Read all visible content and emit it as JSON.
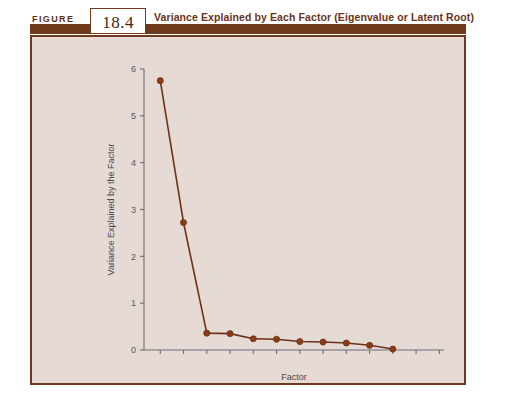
{
  "header": {
    "kicker": "FIGURE",
    "number": "18.4",
    "title": "Variance Explained by Each Factor (Eigenvalue or Latent Root)"
  },
  "colors": {
    "border": "#6e3a1c",
    "header_bar": "#6e3a1c",
    "title_text": "#6b3318",
    "panel_bg": "#e6dad4",
    "series": "#8a3c16",
    "axis": "#6e6a74"
  },
  "chart_data": {
    "type": "line",
    "title": "Variance Explained by Each Factor (Eigenvalue or Latent Root)",
    "xlabel": "Factor",
    "ylabel": "Variance Explained by the Factor",
    "x": [
      1,
      2,
      3,
      4,
      5,
      6,
      7,
      8,
      9,
      10,
      11
    ],
    "values": [
      5.75,
      2.72,
      0.36,
      0.35,
      0.24,
      0.23,
      0.18,
      0.17,
      0.15,
      0.1,
      0.02
    ],
    "ylim": [
      0,
      6
    ],
    "yticks": [
      0,
      1,
      2,
      3,
      4,
      5,
      6
    ],
    "ytick_labels": [
      "0",
      "1",
      "2",
      "3",
      "4",
      "5",
      "6"
    ],
    "xlim": [
      0.3,
      13.2
    ],
    "xticks": [
      1,
      2,
      3,
      4,
      5,
      6,
      7,
      8,
      9,
      10,
      11,
      12,
      13
    ],
    "xtick_labels": [
      "",
      "",
      "",
      "",
      "",
      "",
      "",
      "",
      "",
      "",
      "",
      "",
      ""
    ],
    "grid": false,
    "legend": null,
    "marker": "filled-circle",
    "series_name": "Eigenvalue"
  }
}
